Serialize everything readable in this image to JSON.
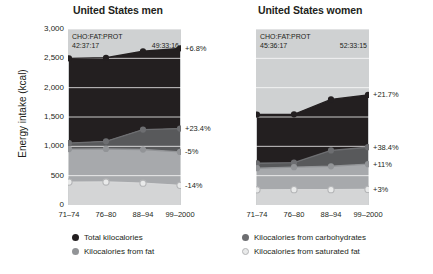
{
  "axis": {
    "ylabel": "Energy intake (kcal)",
    "yticks": [
      "3,000",
      "2,500",
      "2,000",
      "1,500",
      "1,000",
      "500",
      "0"
    ],
    "ytick_values": [
      3000,
      2500,
      2000,
      1500,
      1000,
      500,
      0
    ],
    "xticks": [
      "71–74",
      "76–80",
      "88–94",
      "99–2000"
    ]
  },
  "panels": [
    {
      "key": "men",
      "title": "United States men",
      "ratio_header": "CHO:FAT:PROT",
      "ratio_start": "42:37:17",
      "ratio_end": "49:33:16",
      "pct_labels": [
        "+6.8%",
        "+23.4%",
        "-5%",
        "-14%"
      ]
    },
    {
      "key": "women",
      "title": "United States women",
      "ratio_header": "CHO:FAT:PROT",
      "ratio_start": "45:36:17",
      "ratio_end": "52:33:15",
      "pct_labels": [
        "+21.7%",
        "+38.4%",
        "+11%",
        "+3%"
      ]
    }
  ],
  "legend": [
    {
      "label": "Total kilocalories",
      "color": "#231f20",
      "style": "solid"
    },
    {
      "label": "Kilocalories from carbohydrates",
      "color": "#6d6e71",
      "style": "solid"
    },
    {
      "label": "Kilocalories from fat",
      "color": "#929497",
      "style": "solid"
    },
    {
      "label": "Kilocalories from saturated fat",
      "color": "#d6d7d8",
      "style": "outline"
    }
  ],
  "colors": {
    "total_line": "#231f20",
    "carbs_line": "#6d6e71",
    "fat_line": "#929497",
    "satfat_line": "#d6d7d8",
    "band_above_total": "#cfd1d2",
    "band_total_to_carbs": "#231f20",
    "band_carbs_to_fat": "#58595b",
    "band_fat_to_satfat": "#a7a9ac",
    "band_below_satfat": "#d4d5d6",
    "gridline": "#ffffff",
    "text": "#231f20"
  },
  "chart_data": {
    "type": "area",
    "xlabel": "",
    "ylabel": "Energy intake (kcal)",
    "categories": [
      "71–74",
      "76–80",
      "88–94",
      "99–2000"
    ],
    "ylim": [
      0,
      3000
    ],
    "ytick_interval": 500,
    "grid": true,
    "legend_position": "bottom",
    "panels": [
      {
        "name": "United States men",
        "annotations": {
          "ratio_header": "CHO:FAT:PROT",
          "ratio_start": "42:37:17",
          "ratio_end": "49:33:16"
        },
        "series": [
          {
            "name": "Total kilocalories",
            "values": [
              2500,
              2510,
              2620,
              2670
            ],
            "change_label": "+6.8%",
            "color": "#231f20"
          },
          {
            "name": "Kilocalories from carbohydrates",
            "values": [
              1055,
              1085,
              1285,
              1302
            ],
            "change_label": "+23.4%",
            "color": "#6d6e71"
          },
          {
            "name": "Kilocalories from fat",
            "values": [
              953,
              955,
              945,
              905
            ],
            "change_label": "-5%",
            "color": "#929497"
          },
          {
            "name": "Kilocalories from saturated fat",
            "values": [
              390,
              392,
              372,
              335
            ],
            "change_label": "-14%",
            "color": "#d6d7d8"
          }
        ]
      },
      {
        "name": "United States women",
        "annotations": {
          "ratio_header": "CHO:FAT:PROT",
          "ratio_start": "45:36:17",
          "ratio_end": "52:33:15"
        },
        "series": [
          {
            "name": "Total kilocalories",
            "values": [
              1542,
              1545,
              1800,
              1876
            ],
            "change_label": "+21.7%",
            "color": "#231f20"
          },
          {
            "name": "Kilocalories from carbohydrates",
            "values": [
              712,
              722,
              930,
              985
            ],
            "change_label": "+38.4%",
            "color": "#6d6e71"
          },
          {
            "name": "Kilocalories from fat",
            "values": [
              627,
              645,
              660,
              696
            ],
            "change_label": "+11%",
            "color": "#929497"
          },
          {
            "name": "Kilocalories from saturated fat",
            "values": [
              258,
              262,
              262,
              266
            ],
            "change_label": "+3%",
            "color": "#d6d7d8"
          }
        ]
      }
    ]
  }
}
